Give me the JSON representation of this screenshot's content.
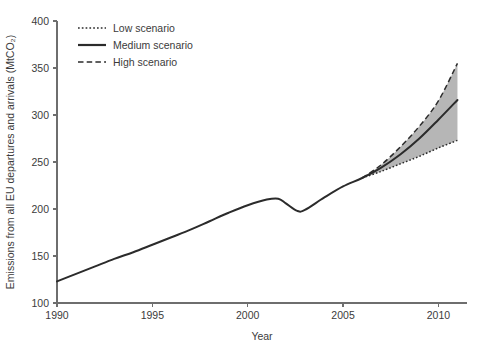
{
  "chart_data": {
    "type": "line",
    "title": "",
    "xlabel": "Year",
    "ylabel": "Emissions from all EU departures and arrivals (MtCO₂)",
    "xlim": [
      1990,
      2011.5
    ],
    "ylim": [
      100,
      400
    ],
    "grid": false,
    "legend_position": "top-left",
    "xticks": [
      1990,
      1995,
      2000,
      2005,
      2010
    ],
    "xtick_labels": [
      "1990",
      "1995",
      "2000",
      "2005",
      "2010"
    ],
    "yticks": [
      100,
      150,
      200,
      250,
      300,
      350,
      400
    ],
    "ytick_labels": [
      "100",
      "150",
      "200",
      "250",
      "300",
      "350",
      "400"
    ],
    "x": [
      1990,
      1991,
      1992,
      1993,
      1994,
      1995,
      1996,
      1997,
      1998,
      1999,
      2000,
      2001,
      2001.6,
      2002,
      2002.6,
      2003,
      2004,
      2005,
      2006,
      2007,
      2008,
      2009,
      2010,
      2011
    ],
    "series": [
      {
        "name": "Low scenario",
        "style": "dotted",
        "values": [
          123,
          131,
          139,
          147,
          154,
          162,
          170,
          178,
          187,
          196,
          204,
          210,
          211,
          206,
          198,
          199,
          212,
          224,
          233,
          240,
          248,
          256,
          265,
          273
        ]
      },
      {
        "name": "Medium scenario",
        "style": "solid",
        "values": [
          123,
          131,
          139,
          147,
          154,
          162,
          170,
          178,
          187,
          196,
          204,
          210,
          211,
          206,
          198,
          199,
          212,
          224,
          233,
          244,
          258,
          275,
          295,
          316
        ]
      },
      {
        "name": "High scenario",
        "style": "dashed",
        "values": [
          123,
          131,
          139,
          147,
          154,
          162,
          170,
          178,
          187,
          196,
          204,
          210,
          211,
          206,
          198,
          199,
          212,
          224,
          233,
          247,
          266,
          288,
          315,
          355
        ]
      }
    ],
    "projection_start_year": 2006,
    "band_fill_color": "#b6b6b6",
    "line_color": "#2b2b2b",
    "axis_color": "#6e6e6e"
  },
  "axes": {
    "x_title": "Year",
    "y_title": "Emissions from all EU departures and arrivals (MtCO₂)"
  },
  "legend": {
    "entries": [
      {
        "label": "Low scenario",
        "style": "dotted"
      },
      {
        "label": "Medium scenario",
        "style": "solid"
      },
      {
        "label": "High scenario",
        "style": "dashed"
      }
    ]
  }
}
